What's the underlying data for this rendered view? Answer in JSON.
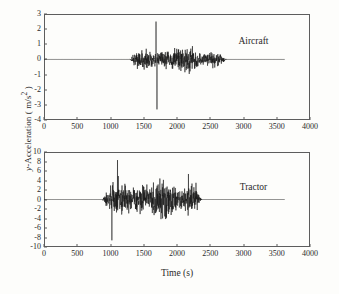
{
  "figure": {
    "background_color": "#fdfdfb",
    "axis_color": "#5d5d5d",
    "trace_color": "#141414",
    "xlabel": "Time (s)",
    "ylabel_prefix": "y",
    "ylabel_rest": "-Acceleration ( m/s",
    "ylabel_exponent": "2",
    "ylabel_close": " )"
  },
  "chart_data": {
    "type": "line",
    "title": "",
    "xlabel": "Time (s)",
    "ylabel": "y-Acceleration ( m/s^2 )",
    "grid": false,
    "legend_position": "inside-right",
    "shared_x": {
      "xlim": [
        0,
        4000
      ],
      "xticks": [
        0,
        500,
        1000,
        1500,
        2000,
        2500,
        3000,
        3500,
        4000
      ],
      "xtick_labels": [
        "0",
        "500",
        "1000",
        "1500",
        "2000",
        "2500",
        "3000",
        "3500",
        "4000"
      ]
    },
    "panels": [
      {
        "name": "aircraft",
        "label": "Aircraft",
        "label_x": 3150,
        "label_y": 1.25,
        "ylim": [
          -4,
          3
        ],
        "yticks": [
          3,
          2,
          1,
          0,
          -1,
          -2,
          -3,
          -4
        ],
        "ytick_labels": [
          "3",
          "2",
          "1",
          "0",
          "-1",
          "-2",
          "-3",
          "-4"
        ],
        "baseline_start": 0,
        "baseline_end": 3620,
        "signal_start": 1280,
        "signal_end": 2750,
        "peak_max": 2.5,
        "peak_max_time": 1685,
        "peak_min": -3.3,
        "peak_min_time": 1700,
        "typical_amplitude": 0.7,
        "units": "m/s^2"
      },
      {
        "name": "tractor",
        "label": "Tractor",
        "label_x": 3150,
        "label_y": 2.6,
        "ylim": [
          -10,
          10
        ],
        "yticks": [
          10,
          8,
          6,
          4,
          2,
          0,
          -2,
          -4,
          -6,
          -8,
          -10
        ],
        "ytick_labels": [
          "10",
          "8",
          "6",
          "4",
          "2",
          "0",
          "-2",
          "-4",
          "-6",
          "-8",
          "-10"
        ],
        "baseline_start": 0,
        "baseline_end": 3620,
        "signal_start": 870,
        "signal_end": 2380,
        "peak_max": 8.3,
        "peak_max_time": 1105,
        "peak_min": -8.6,
        "peak_min_time": 1020,
        "typical_amplitude": 4.0,
        "units": "m/s^2"
      }
    ]
  }
}
